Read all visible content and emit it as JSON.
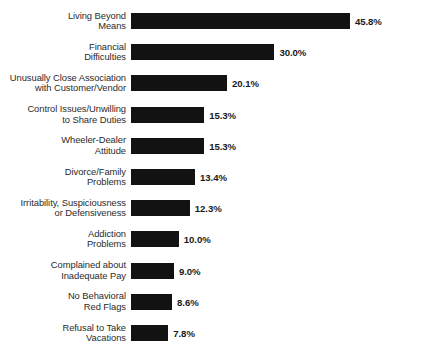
{
  "chart_data": {
    "type": "bar",
    "orientation": "horizontal",
    "title": "",
    "subtitle": "",
    "xlabel": "",
    "ylabel": "",
    "grid": false,
    "legend": null,
    "xlim": [
      0,
      45.8
    ],
    "value_suffix": "%",
    "categories": [
      "Living Beyond\nMeans",
      "Financial\nDifficulties",
      "Unusually Close Association\nwith Customer/Vendor",
      "Control Issues/Unwilling\nto Share Duties",
      "Wheeler-Dealer\nAttitude",
      "Divorce/Family\nProblems",
      "Irritability, Suspiciousness\nor Defensiveness",
      "Addiction\nProblems",
      "Complained about\nInadequate Pay",
      "No Behavioral\nRed Flags",
      "Refusal to Take\nVacations"
    ],
    "values": [
      45.8,
      30.0,
      20.1,
      15.3,
      15.3,
      13.4,
      12.3,
      10.0,
      9.0,
      8.6,
      7.8
    ],
    "value_labels": [
      "45.8%",
      "30.0%",
      "20.1%",
      "15.3%",
      "15.3%",
      "13.4%",
      "12.3%",
      "10.0%",
      "9.0%",
      "8.6%",
      "7.8%"
    ],
    "colors": {
      "bar": "#121212",
      "background": "#ffffff",
      "category_label": "#2b2b2b",
      "value_label": "#1a1a1a"
    }
  }
}
